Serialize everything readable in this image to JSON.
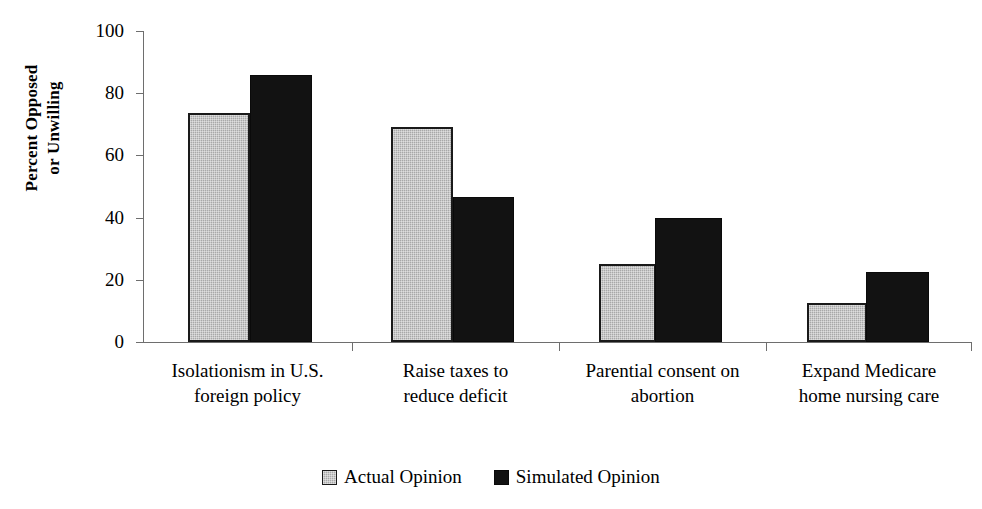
{
  "chart_data": {
    "type": "bar",
    "title": "",
    "xlabel": "",
    "ylabel_lines": [
      "Percent Opposed",
      "or Unwilling"
    ],
    "ylim": [
      0,
      100
    ],
    "ytick_labels": [
      "100",
      "80",
      "60",
      "40",
      "20",
      "0"
    ],
    "ytick_values": [
      100,
      80,
      60,
      40,
      20,
      0
    ],
    "grid": false,
    "legend_position": "bottom-center",
    "categories": [
      [
        "Isolationism in U.S.",
        "foreign policy"
      ],
      [
        "Raise taxes to",
        "reduce deficit"
      ],
      [
        "Parential consent on",
        "abortion"
      ],
      [
        "Expand Medicare",
        "home nursing care"
      ]
    ],
    "category_labels_flat": [
      "Isolationism in U.S. foreign policy",
      "Raise taxes to reduce deficit",
      "Parential consent on abortion",
      "Expand Medicare home nursing care"
    ],
    "series": [
      {
        "name": "Actual Opinion",
        "color": "#a8a8a8",
        "values": [
          73.5,
          69,
          25,
          12.5
        ]
      },
      {
        "name": "Simulated Opinion",
        "color": "#121212",
        "values": [
          86,
          46.5,
          40,
          22.5
        ]
      }
    ]
  },
  "legend": {
    "items": [
      {
        "label": "Actual Opinion",
        "swatch": "gray-swatch"
      },
      {
        "label": "Simulated Opinion",
        "swatch": "black-swatch"
      }
    ]
  }
}
